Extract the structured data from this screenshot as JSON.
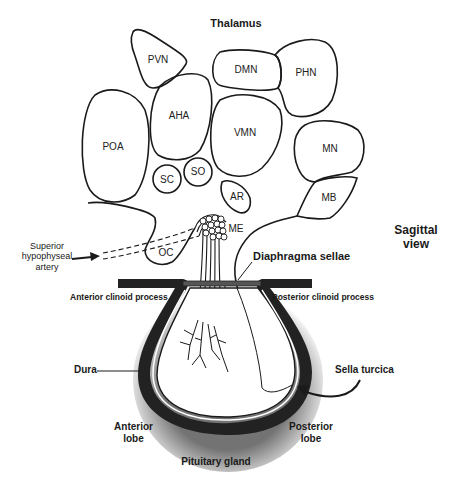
{
  "view_label": "Sagittal\nview",
  "view_label_lines": [
    "Sagittal",
    "view"
  ],
  "top_label": "Thalamus",
  "nuclei": {
    "pvn": "PVN",
    "dmn": "DMN",
    "phn": "PHN",
    "aha": "AHA",
    "poa": "POA",
    "vmn": "VMN",
    "mn": "MN",
    "sc": "SC",
    "so": "SO",
    "ar": "AR",
    "mb": "MB",
    "me": "ME",
    "oc": "OC"
  },
  "labels": {
    "artery_line1": "Superior",
    "artery_line2": "hypophyseal",
    "artery_line3": "artery",
    "diaphragma": "Diaphragma sellae",
    "anterior_clinoid": "Anterior clinoid process",
    "posterior_clinoid": "Posterior clinoid process",
    "dura": "Dura",
    "sella": "Sella turcica",
    "anterior_lobe_1": "Anterior",
    "anterior_lobe_2": "lobe",
    "posterior_lobe_1": "Posterior",
    "posterior_lobe_2": "lobe",
    "gland": "Pituitary gland"
  },
  "colors": {
    "outline": "#1a1a1a",
    "bone": "#222222",
    "background": "#ffffff"
  }
}
